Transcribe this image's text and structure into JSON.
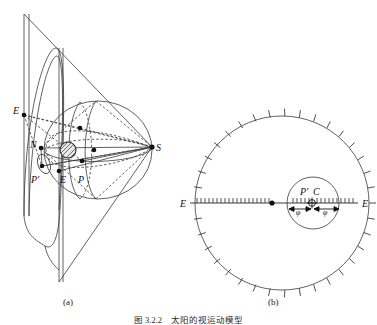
{
  "figure": {
    "panel_a_caption": "(a)",
    "panel_b_caption": "(b)",
    "figure_caption": "图 3.2.2　太阳的视运动模型",
    "line_color": "#3a3a3a",
    "dash_color": "#4a4a4a",
    "point_color": "#111111",
    "background": "#ffffff"
  },
  "panel_a": {
    "name": "oblique-perspective-sphere-and-cone",
    "labels": [
      {
        "id": "label-E-left",
        "text": "E",
        "x": 16,
        "y": 111,
        "italic": true
      },
      {
        "id": "label-N",
        "text": "N",
        "x": 33,
        "y": 148,
        "italic": true
      },
      {
        "id": "label-S",
        "text": "S",
        "x": 155,
        "y": 150,
        "italic": true
      },
      {
        "id": "label-Pprime",
        "text": "P'",
        "x": 33,
        "y": 180,
        "italic": true
      },
      {
        "id": "label-E-inner",
        "text": "E",
        "x": 62,
        "y": 180,
        "italic": true
      },
      {
        "id": "label-P",
        "text": "P",
        "x": 79,
        "y": 180,
        "italic": true
      }
    ],
    "points": [
      {
        "id": "pt-E-left",
        "x": 24,
        "y": 115
      },
      {
        "id": "pt-N",
        "x": 41,
        "y": 148
      },
      {
        "id": "pt-S",
        "x": 152,
        "y": 147
      },
      {
        "id": "pt-Pprime",
        "x": 42,
        "y": 166
      },
      {
        "id": "pt-E-mid",
        "x": 59,
        "y": 171
      },
      {
        "id": "pt-P",
        "x": 82,
        "y": 161
      },
      {
        "id": "pt-top",
        "x": 80,
        "y": 128
      },
      {
        "id": "pt-center",
        "x": 94,
        "y": 150
      }
    ],
    "shaded_disc": {
      "cx": 68,
      "cy": 150,
      "r": 8
    },
    "sphere": {
      "cx": 98,
      "cy": 150,
      "rx": 54,
      "ry": 49
    }
  },
  "panel_b": {
    "name": "celestial-dial-with-inner-circle",
    "outer_circle": {
      "cx": 282,
      "cy": 203,
      "r": 87
    },
    "inner_circle": {
      "cx": 313,
      "cy": 203,
      "r": 26
    },
    "tick_count_outer": 36,
    "axis_line_label_right": "E",
    "axis_line_label_left": "E",
    "labels": [
      {
        "id": "label-Pprime-b",
        "text": "P'",
        "x": 304,
        "y": 192,
        "italic": true
      },
      {
        "id": "label-C-b",
        "text": "C",
        "x": 315,
        "y": 192,
        "italic": true
      },
      {
        "id": "label-phi-left",
        "text": "φ",
        "x": 298,
        "y": 212,
        "italic": true
      },
      {
        "id": "label-phi-right",
        "text": "φ",
        "x": 325,
        "y": 212,
        "italic": true
      },
      {
        "id": "label-E-right",
        "text": "E",
        "x": 360,
        "y": 199,
        "italic": true
      },
      {
        "id": "label-E-left-b",
        "text": "E",
        "x": 184,
        "y": 199,
        "italic": true
      }
    ],
    "points": [
      {
        "id": "pt-center-outer",
        "x": 272,
        "y": 203
      },
      {
        "id": "pt-crosshair",
        "x": 312,
        "y": 203
      }
    ]
  }
}
